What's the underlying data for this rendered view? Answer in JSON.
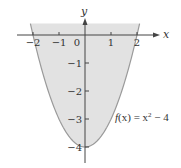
{
  "chart_data": {
    "type": "area",
    "title": "",
    "function": "f(x) = x^2 - 4",
    "annotation": {
      "text_prefix": "f(x) = x",
      "exponent": "2",
      "text_suffix": " − 4"
    },
    "xlabel": "x",
    "ylabel": "y",
    "x_ticks": [
      -2,
      -1,
      0,
      1,
      2
    ],
    "x_tick_labels": [
      "−2",
      "−1",
      "0",
      "1",
      "2"
    ],
    "y_ticks": [
      -1,
      -2,
      -3,
      -4
    ],
    "y_tick_labels": [
      "−1",
      "−2",
      "−3",
      "−4"
    ],
    "xlim": [
      -2.6,
      2.8
    ],
    "ylim": [
      -4.6,
      1.2
    ],
    "shaded_region": "between x-axis and curve for x in [-2, 2] (and curve extending slightly above axis)",
    "series": [
      {
        "name": "f(x) = x^2 - 4",
        "x": [
          -2.1,
          -2,
          -1.5,
          -1,
          -0.5,
          0,
          0.5,
          1,
          1.5,
          2,
          2.1
        ],
        "y": [
          0.41,
          0,
          -1.75,
          -3,
          -3.75,
          -4,
          -3.75,
          -3,
          -1.75,
          0,
          0.41
        ]
      }
    ],
    "grid": false,
    "colors": {
      "fill": "#e2e2e2",
      "curve": "#9a9a9a",
      "axis": "#444444"
    }
  }
}
